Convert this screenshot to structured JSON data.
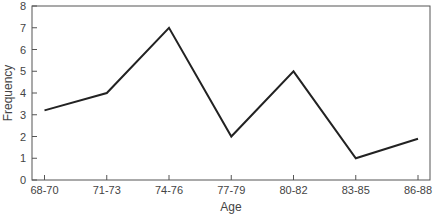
{
  "chart_data": {
    "type": "line",
    "title": "",
    "xlabel": "Age",
    "ylabel": "Frequency",
    "categories": [
      "68-70",
      "71-73",
      "74-76",
      "77-79",
      "80-82",
      "83-85",
      "86-88"
    ],
    "values": [
      3.2,
      4,
      7,
      2,
      5,
      1,
      1.9
    ],
    "ylim": [
      0,
      8
    ],
    "yticks": [
      0,
      1,
      2,
      3,
      4,
      5,
      6,
      7,
      8
    ],
    "grid": false,
    "legend": null,
    "line_color": "#222222",
    "axis_color": "#555555"
  }
}
